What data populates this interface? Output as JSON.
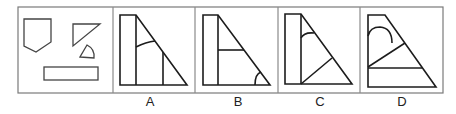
{
  "puzzle": {
    "type": "shape-composition",
    "given_panel": {
      "pieces": [
        {
          "name": "pentagon",
          "points": [
            [
              24,
              19
            ],
            [
              51,
              19
            ],
            [
              51,
              42
            ],
            [
              36,
              52
            ],
            [
              24,
              46
            ]
          ]
        },
        {
          "name": "right-triangle",
          "points": [
            [
              73,
              24
            ],
            [
              100,
              24
            ],
            [
              73,
              46
            ]
          ]
        },
        {
          "name": "small-sector",
          "vertex": [
            80,
            57
          ],
          "base_end": [
            94,
            58
          ],
          "arc_top": [
            87,
            45
          ]
        },
        {
          "name": "rectangle",
          "x": 44,
          "y": 67,
          "width": 54,
          "height": 13
        }
      ]
    },
    "options": [
      {
        "label": "A"
      },
      {
        "label": "B"
      },
      {
        "label": "C"
      },
      {
        "label": "D"
      }
    ]
  },
  "colors": {
    "frame": "#7a7a7a",
    "line": "#1c1c1c",
    "background": "#ffffff"
  }
}
